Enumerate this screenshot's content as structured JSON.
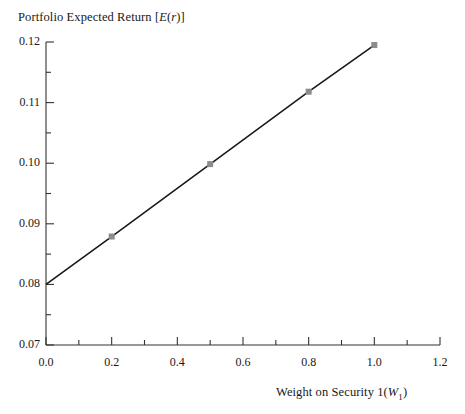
{
  "chart_data": {
    "type": "line",
    "title": "Portfolio Expected Return [E(r)]",
    "title_parts": {
      "lead": "Portfolio Expected Return [",
      "e_italic": "E",
      "open_paren": "(",
      "r_italic": "r",
      "close": ")]"
    },
    "xlabel": "Weight on Security 1(W1)",
    "xlabel_parts": {
      "lead": "Weight on Security 1(",
      "w_italic": "W",
      "subscript": "1",
      "close": ")"
    },
    "ylabel": "",
    "xlim": [
      0.0,
      1.2
    ],
    "ylim": [
      0.07,
      0.12
    ],
    "grid": false,
    "legend": "none",
    "x_major_ticks": [
      0.0,
      0.2,
      0.4,
      0.6,
      0.8,
      1.0,
      1.2
    ],
    "x_major_tick_labels": [
      "0.0",
      "0.2",
      "0.4",
      "0.6",
      "0.8",
      "1.0",
      "1.2"
    ],
    "x_minor_ticks": [
      0.1,
      0.3,
      0.5,
      0.7,
      0.9,
      1.1
    ],
    "y_major_ticks": [
      0.07,
      0.08,
      0.09,
      0.1,
      0.11,
      0.12
    ],
    "y_major_tick_labels": [
      "0.07",
      "0.08",
      "0.09",
      "0.10",
      "0.11",
      "0.12"
    ],
    "y_minor_ticks": [
      0.075,
      0.085,
      0.095,
      0.105,
      0.115
    ],
    "series": [
      {
        "name": "Portfolio Expected Return",
        "line_color": "#1a1a1a",
        "line_width": 1.6,
        "marker": "square",
        "marker_color": "#8c8c8c",
        "marker_size": 6,
        "x": [
          0.0,
          0.2,
          0.5,
          0.8,
          1.0
        ],
        "y": [
          0.08,
          0.0879,
          0.09985,
          0.1118,
          0.1195
        ]
      }
    ]
  },
  "colors": {
    "background": "#ffffff",
    "axis": "#333333",
    "line": "#1a1a1a",
    "marker": "#8c8c8c",
    "text": "#191919"
  }
}
